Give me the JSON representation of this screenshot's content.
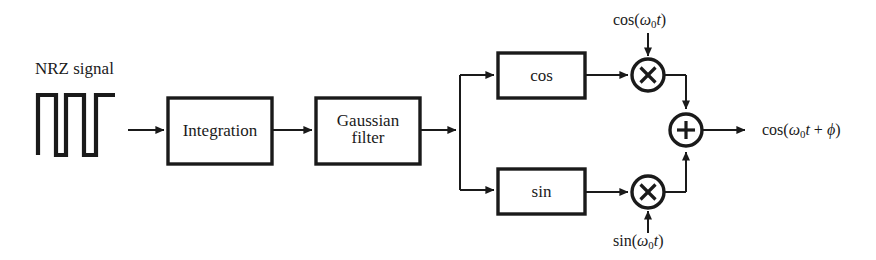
{
  "diagram": {
    "line_color": "#1a1a1a",
    "text_color": "#1a1a1a",
    "background": "#ffffff",
    "input": {
      "label": "NRZ signal",
      "waveform_name": "nrz-square-wave"
    },
    "blocks": [
      {
        "id": "integration",
        "label": "Integration"
      },
      {
        "id": "gaussian",
        "label_line1": "Gaussian",
        "label_line2": "filter"
      },
      {
        "id": "cos",
        "label": "cos"
      },
      {
        "id": "sin",
        "label": "sin"
      }
    ],
    "operators": [
      {
        "id": "mult-cos",
        "symbol": "×",
        "name": "multiplier"
      },
      {
        "id": "mult-sin",
        "symbol": "×",
        "name": "multiplier"
      },
      {
        "id": "adder",
        "symbol": "+",
        "name": "summing-junction"
      }
    ],
    "carriers": {
      "top": {
        "fn": "cos",
        "open": "(",
        "omega": "ω",
        "sub": "0",
        "t": "t",
        "close": ")"
      },
      "bottom": {
        "fn": "sin",
        "open": "(",
        "omega": "ω",
        "sub": "0",
        "t": "t",
        "close": ")"
      }
    },
    "output": {
      "fn": "cos",
      "open": "(",
      "omega": "ω",
      "sub": "0",
      "t": "t",
      "plus": " + ",
      "phi": "ϕ",
      "close": ")"
    }
  }
}
